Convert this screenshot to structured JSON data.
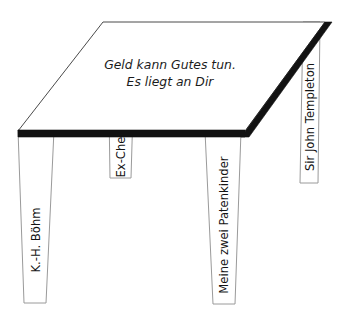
{
  "diagram": {
    "type": "isometric-table-metaphor",
    "title_on_top": {
      "line1": "Geld kann Gutes tun.",
      "line2": "Es liegt an Dir"
    },
    "colors": {
      "background": "#ffffff",
      "table_top_fill": "#ffffff",
      "table_top_outline": "#4a4a4a",
      "edge_band": "#121212",
      "leg_fill": "#ffffff",
      "leg_outline": "#9a9a9a",
      "text": "#1c1c1c"
    },
    "legs": [
      {
        "id": "leg-1",
        "label": "K.-H. Böhm",
        "position": "front-left"
      },
      {
        "id": "leg-2",
        "label": "Ex-Chef",
        "position": "back-left"
      },
      {
        "id": "leg-3",
        "label": "Meine zwei Patenkinder",
        "position": "front-right"
      },
      {
        "id": "leg-4",
        "label": "Sir John Templeton",
        "position": "back-right"
      }
    ]
  }
}
